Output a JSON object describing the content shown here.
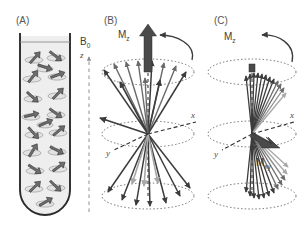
{
  "figure": {
    "background": "#ffffff",
    "width": 306,
    "height": 229
  },
  "colors": {
    "tube_outline": "#2b2b2b",
    "tube_fill": "#eeeeee",
    "spin_arrow": "#6e6e6e",
    "spin_arrow_edge": "#2e2e2e",
    "ellipse_fill": "#e2e2e2",
    "vector_dark": "#3c3c3c",
    "vector_mid": "#6a6a6a",
    "vector_light": "#a8a8a8",
    "mz_arrow": "#4a4a4a",
    "dotted_ellipse": "#6b6b6b",
    "axis_dash": "#2f2f2f",
    "b0_dash": "#9a9a9a",
    "text": "#4a4a4a"
  },
  "panels": [
    {
      "id": "A",
      "label": "(A)",
      "caption_meaning": "Randomly oriented nuclear spins in a sample tube within field B0",
      "b0_label": "B",
      "b0_subscript": "0",
      "z_label": "z",
      "spin_count": 19,
      "spins": [
        {
          "cx": 34,
          "cy": 57,
          "angle": -48
        },
        {
          "cx": 56,
          "cy": 55,
          "angle": 38
        },
        {
          "cx": 32,
          "cy": 76,
          "angle": -52
        },
        {
          "cx": 57,
          "cy": 74,
          "angle": -20
        },
        {
          "cx": 33,
          "cy": 96,
          "angle": 42
        },
        {
          "cx": 57,
          "cy": 93,
          "angle": -46
        },
        {
          "cx": 31,
          "cy": 114,
          "angle": -14
        },
        {
          "cx": 56,
          "cy": 112,
          "angle": 36
        },
        {
          "cx": 34,
          "cy": 132,
          "angle": 48
        },
        {
          "cx": 58,
          "cy": 130,
          "angle": -40
        },
        {
          "cx": 32,
          "cy": 150,
          "angle": -58
        },
        {
          "cx": 57,
          "cy": 149,
          "angle": 28
        },
        {
          "cx": 35,
          "cy": 168,
          "angle": 34
        },
        {
          "cx": 58,
          "cy": 166,
          "angle": -36
        },
        {
          "cx": 34,
          "cy": 186,
          "angle": -44
        },
        {
          "cx": 56,
          "cy": 185,
          "angle": 44
        },
        {
          "cx": 45,
          "cy": 201,
          "angle": -30
        },
        {
          "cx": 45,
          "cy": 66,
          "angle": 18
        },
        {
          "cx": 45,
          "cy": 122,
          "angle": -24
        }
      ]
    },
    {
      "id": "B",
      "label": "(B)",
      "caption_meaning": "Net longitudinal magnetization Mz along z with spins precessing out of phase on double cone",
      "mz_label": "M",
      "mz_subscript": "z",
      "x_axis_label": "x",
      "y_axis_label": "y",
      "precession_arrow": "curved-arrow-counterclockwise",
      "upper_cone_vectors": 11,
      "lower_cone_vectors": 10
    },
    {
      "id": "C",
      "label": "(C)",
      "caption_meaning": "After 90 degree pulse: transverse magnetization Mxy with spins in phase, Mz reduced to zero",
      "mz_label": "M",
      "mz_subscript": "z",
      "mxy_label": "M",
      "mxy_subscript": "xy",
      "x_axis_label": "x",
      "y_axis_label": "y",
      "precession_arrow": "curved-arrow-counterclockwise",
      "upper_fan_vectors": 12,
      "lower_fan_vectors": 12
    }
  ]
}
